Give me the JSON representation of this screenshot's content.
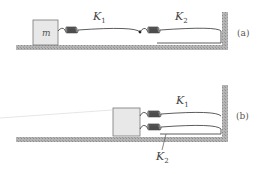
{
  "figure_a": {
    "mass_label": "m",
    "spring1": {
      "symbol": "K",
      "subscript": "1"
    },
    "spring2": {
      "symbol": "K",
      "subscript": "2"
    },
    "tag": "(a)",
    "arrangement": "series"
  },
  "figure_b": {
    "spring1": {
      "symbol": "K",
      "subscript": "1"
    },
    "spring2": {
      "symbol": "K",
      "subscript": "2"
    },
    "tag": "(b)",
    "arrangement": "parallel"
  },
  "colors": {
    "ground": "#a9a9a9",
    "block_fill": "#e8e8e8",
    "block_stroke": "#777777",
    "spring": "#333333"
  }
}
